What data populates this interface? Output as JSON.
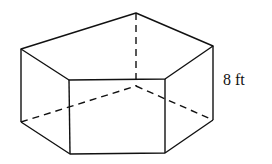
{
  "figure": {
    "type": "pentagonal-prism",
    "height_label": "8 ft",
    "stroke_color": "#111111",
    "background": "#ffffff"
  }
}
